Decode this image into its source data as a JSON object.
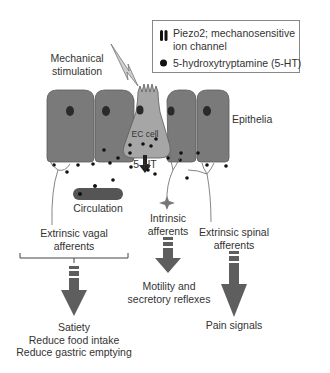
{
  "diagram": {
    "title": "",
    "colors": {
      "epithelial_cell": "#7a7a7a",
      "ec_cell": "#a6a6a6",
      "nucleus": "#2a2a2a",
      "serotonin_dot": "#111111",
      "arrow": "#5e5e5e",
      "circulation_vessel": "#555555",
      "text": "#333333"
    },
    "legend": {
      "items": [
        {
          "icon": "piezo2-channel-icon",
          "label_line1": "Piezo2; mechanosensitive",
          "label_line2": "ion channel"
        },
        {
          "icon": "serotonin-dot-icon",
          "label_line1": "5-hydroxytryptamine (5-HT)"
        }
      ]
    },
    "labels": {
      "mechanical_line1": "Mechanical",
      "mechanical_line2": "stimulation",
      "epithelia": "Epithelia",
      "ec_cell": "EC cell",
      "serotonin": "5-HT",
      "circulation": "Circulation",
      "vagal_line1": "Extrinsic vagal",
      "vagal_line2": "afferents",
      "intrinsic_line1": "Intrinsic",
      "intrinsic_line2": "afferents",
      "spinal_line1": "Extrinsic spinal",
      "spinal_line2": "afferents"
    },
    "outcomes": {
      "vagal": [
        "Satiety",
        "Reduce food intake",
        "Reduce gastric emptying"
      ],
      "intrinsic": [
        "Motility and",
        "secretory reflexes"
      ],
      "spinal": [
        "Pain signals"
      ]
    },
    "nodes": [
      "Mechanical stimulation",
      "EC cell",
      "Epithelia",
      "5-HT",
      "Circulation",
      "Extrinsic vagal afferents",
      "Intrinsic afferents",
      "Extrinsic spinal afferents",
      "Satiety / Reduce food intake / Reduce gastric emptying",
      "Motility and secretory reflexes",
      "Pain signals"
    ],
    "edges": [
      {
        "from": "Mechanical stimulation",
        "to": "EC cell"
      },
      {
        "from": "EC cell",
        "to": "5-HT"
      },
      {
        "from": "5-HT",
        "to": "Circulation"
      },
      {
        "from": "5-HT",
        "to": "Extrinsic vagal afferents"
      },
      {
        "from": "5-HT",
        "to": "Intrinsic afferents"
      },
      {
        "from": "5-HT",
        "to": "Extrinsic spinal afferents"
      },
      {
        "from": "Extrinsic vagal afferents",
        "to": "Satiety / Reduce food intake / Reduce gastric emptying"
      },
      {
        "from": "Intrinsic afferents",
        "to": "Motility and secretory reflexes"
      },
      {
        "from": "Extrinsic spinal afferents",
        "to": "Pain signals"
      }
    ]
  }
}
